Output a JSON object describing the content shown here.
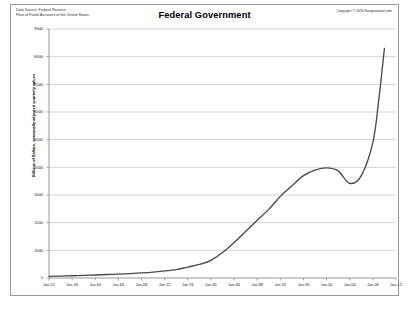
{
  "header": {
    "source_line1": "Data Source: Federal Reserve",
    "source_line2": "Flow of Funds  Accounts of the United States",
    "title": "Federal Government",
    "copyright": "Copyright © 2010 Kangarootail.com"
  },
  "chart_data": {
    "type": "line",
    "title": "Federal Government",
    "xlabel": "",
    "ylabel": "Billions of Dollars, seasonally adjusted quarterly values",
    "ylim": [
      0,
      9000
    ],
    "ytick_step": 1000,
    "yticks": [
      "0",
      "1000",
      "2000",
      "3000",
      "4000",
      "5000",
      "6000",
      "7000",
      "8000",
      "9000"
    ],
    "xlim": [
      "Jan-52",
      "Jan-12"
    ],
    "xticks": [
      "Jan-52",
      "Jan-56",
      "Jan-60",
      "Jan-64",
      "Jan-68",
      "Jan-72",
      "Jan-76",
      "Jan-80",
      "Jan-84",
      "Jan-88",
      "Jan-92",
      "Jan-96",
      "Jan-00",
      "Jan-04",
      "Jan-08",
      "Jan-12"
    ],
    "grid": "horizontal",
    "legend": "none",
    "line_color": "#4a4a4a",
    "series": [
      {
        "name": "Federal Government",
        "x": [
          1952,
          1954,
          1956,
          1958,
          1960,
          1962,
          1964,
          1966,
          1968,
          1970,
          1972,
          1974,
          1976,
          1978,
          1980,
          1982,
          1984,
          1986,
          1988,
          1990,
          1992,
          1994,
          1996,
          1998,
          2000,
          2002,
          2004,
          2006,
          2008,
          2009,
          2010
        ],
        "values": [
          60,
          70,
          80,
          95,
          110,
          125,
          140,
          160,
          185,
          215,
          255,
          300,
          395,
          490,
          640,
          920,
          1280,
          1680,
          2090,
          2480,
          2950,
          3330,
          3700,
          3900,
          3980,
          3870,
          3420,
          3700,
          4900,
          6400,
          8300
        ]
      }
    ]
  }
}
